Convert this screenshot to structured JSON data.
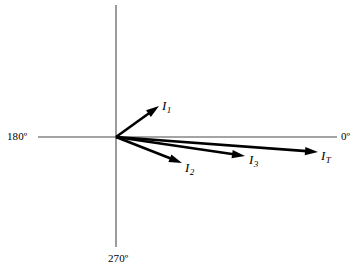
{
  "figure": {
    "type": "phasor-diagram",
    "width": 354,
    "height": 272,
    "background_color": "#ffffff",
    "stroke_color": "#000000",
    "axis_color": "#4a4a4a"
  },
  "axes": {
    "origin": {
      "x": 116,
      "y": 137
    },
    "horizontal": {
      "x1": 38,
      "y1": 137,
      "x2": 337,
      "y2": 137
    },
    "vertical": {
      "x1": 116,
      "y1": 5,
      "x2": 116,
      "y2": 247
    },
    "labels": {
      "left": "180º",
      "right": "0º",
      "bottom": "270º"
    }
  },
  "chart_data": {
    "type": "scatter",
    "title": "",
    "xlabel": "",
    "ylabel": "",
    "plot_style": "phasor",
    "angle_reference": {
      "zero": "0º",
      "left": "180º",
      "down": "270º"
    },
    "vectors": [
      {
        "name": "I1",
        "label": "I",
        "subscript": "1",
        "angle_deg": 35.6,
        "length_px": 53,
        "tip": {
          "x": 159,
          "y": 106
        },
        "quadrant": "upper-right"
      },
      {
        "name": "I2",
        "label": "I",
        "subscript": "2",
        "angle_deg": -21.4,
        "length_px": 71,
        "tip": {
          "x": 182,
          "y": 163
        },
        "quadrant": "lower-right"
      },
      {
        "name": "I3",
        "label": "I",
        "subscript": "3",
        "angle_deg": -8.6,
        "length_px": 130,
        "tip": {
          "x": 245,
          "y": 156
        },
        "quadrant": "lower-right"
      },
      {
        "name": "IT",
        "label": "I",
        "subscript": "T",
        "angle_deg": -4.3,
        "length_px": 203,
        "tip": {
          "x": 318,
          "y": 152
        },
        "quadrant": "lower-right"
      }
    ]
  },
  "labels": {
    "axis_180": "180º",
    "axis_0": "0º",
    "axis_270": "270º",
    "i1_base": "I",
    "i1_sub": "1",
    "i2_base": "I",
    "i2_sub": "2",
    "i3_base": "I",
    "i3_sub": "3",
    "it_base": "I",
    "it_sub": "T"
  }
}
